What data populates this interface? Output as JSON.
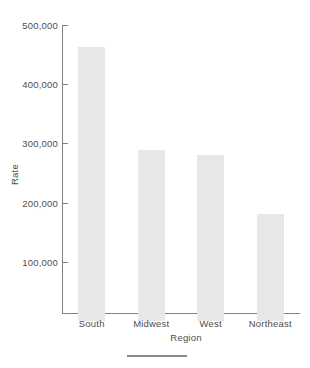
{
  "chart_data": {
    "type": "bar",
    "title": "",
    "subtitle": "",
    "xlabel": "Region",
    "ylabel": "Rate",
    "categories": [
      "South",
      "Midwest",
      "West",
      "Northeast"
    ],
    "values": [
      463000,
      289000,
      281000,
      180000
    ],
    "series": [
      {
        "name": "Rate",
        "values": [
          463000,
          289000,
          281000,
          180000
        ]
      }
    ],
    "ylim": [
      0,
      500000
    ],
    "ytick_values": [
      100000,
      200000,
      300000,
      400000,
      500000
    ],
    "ytick_labels": [
      "100,000",
      "200,000",
      "300,000",
      "400,000",
      "500,000"
    ],
    "grid": false,
    "legend": false,
    "legend_position": "none",
    "bar_color": "#e7e7e7",
    "axis_color": "#808080",
    "text_color": "#4d4d4d",
    "background_color": "#ffffff",
    "annotations": []
  },
  "figure": {
    "footer_rule": ""
  }
}
